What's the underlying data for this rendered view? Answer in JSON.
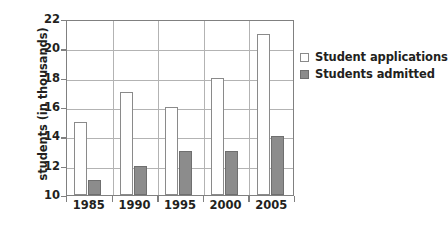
{
  "chart_data": {
    "type": "bar",
    "title": "",
    "xlabel": "",
    "ylabel": "students (in thousands)",
    "categories": [
      "1985",
      "1990",
      "1995",
      "2000",
      "2005"
    ],
    "series": [
      {
        "name": "Student applications",
        "values": [
          15,
          17,
          16,
          18,
          21
        ],
        "color": "#ffffff"
      },
      {
        "name": "Students admitted",
        "values": [
          11,
          12,
          13,
          13,
          14
        ],
        "color": "#8c8c8c"
      }
    ],
    "ylim": [
      10,
      22
    ],
    "yticks": [
      10,
      12,
      14,
      16,
      18,
      20,
      22
    ],
    "ytick_labels": [
      "10",
      "12",
      "14",
      "16",
      "18",
      "20",
      "22"
    ],
    "grid": true,
    "legend_position": "right"
  },
  "legend": {
    "items": [
      {
        "label": "Student applications",
        "swatch": "open-square-swatch"
      },
      {
        "label": "Students admitted",
        "swatch": "filled-square-swatch"
      }
    ]
  },
  "colors": {
    "bar_admitted": "#8c8c8c",
    "bar_applications": "#ffffff",
    "bar_outline": "#8a8a8a",
    "axis": "#808080",
    "gridline": "#b3b3b3",
    "text": "#231f20"
  }
}
